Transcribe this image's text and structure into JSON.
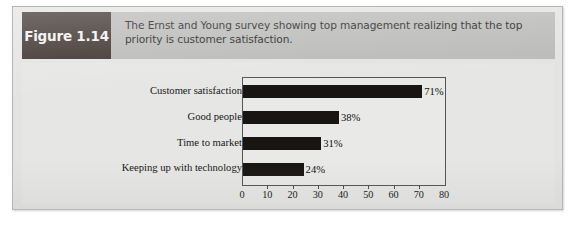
{
  "figure": {
    "number_label": "Figure 1.14",
    "caption": "The Ernst and Young survey showing top management realizing that the top priority is customer satisfaction."
  },
  "colors": {
    "figure_number_box": "#3a302c",
    "header_band": "#b9b9b7",
    "body_background": "#e6e6e4",
    "bar_fill": "#191512",
    "plot_border": "#555452"
  },
  "chart_data": {
    "type": "bar",
    "orientation": "horizontal",
    "title": "",
    "xlabel": "",
    "ylabel": "",
    "grid": false,
    "legend": "none",
    "xlim": [
      0,
      80
    ],
    "xticks": [
      0,
      10,
      20,
      30,
      40,
      50,
      60,
      70,
      80
    ],
    "xtick_labels": [
      "0",
      "10",
      "20",
      "30",
      "40",
      "50",
      "60",
      "70",
      "80"
    ],
    "categories": [
      "Customer satisfaction",
      "Good people",
      "Time to market",
      "Keeping up with technology"
    ],
    "values": [
      71,
      38,
      31,
      24
    ],
    "data_labels": [
      "71%",
      "38%",
      "31%",
      "24%"
    ]
  }
}
